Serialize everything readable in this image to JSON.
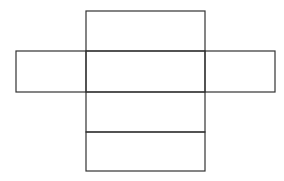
{
  "diagram": {
    "title": "",
    "type": "cuboid-net",
    "line_color": "#333333",
    "background": "#ffffff",
    "faces": [
      {
        "id": "top",
        "label": ""
      },
      {
        "id": "front",
        "label": ""
      },
      {
        "id": "bottom",
        "label": ""
      },
      {
        "id": "back",
        "label": ""
      },
      {
        "id": "left",
        "label": ""
      },
      {
        "id": "right",
        "label": ""
      }
    ]
  }
}
